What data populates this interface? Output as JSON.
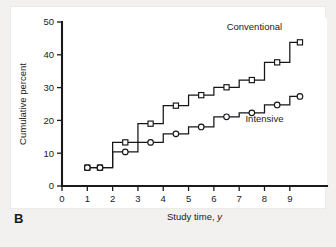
{
  "figure": {
    "panel_label": "B",
    "background_color": "#f2f1ef",
    "plot_background_color": "#ffffff",
    "line_color": "#15161a"
  },
  "chart_data": {
    "type": "line",
    "title": "",
    "subtitle": "",
    "xlabel": "Study time, y",
    "xlabel_parts": {
      "text": "Study time,",
      "italic_unit": "y"
    },
    "ylabel": "Cumulative percent",
    "xlim": [
      0,
      9.6
    ],
    "ylim": [
      0,
      50
    ],
    "xticks": [
      0,
      1,
      2,
      3,
      4,
      5,
      6,
      7,
      8,
      9
    ],
    "xtick_labels": [
      "0",
      "1",
      "2",
      "3",
      "4",
      "5",
      "6",
      "7",
      "8",
      "9"
    ],
    "yticks": [
      0,
      10,
      20,
      30,
      40,
      50
    ],
    "ytick_labels": [
      "0",
      "10",
      "20",
      "30",
      "40",
      "50"
    ],
    "grid": false,
    "legend_position": "inline-annotation",
    "step_type": "post",
    "series": [
      {
        "name": "Conventional",
        "marker": "square",
        "label_x": 7.6,
        "label_y": 47.5,
        "x": [
          1.0,
          1.5,
          2.5,
          3.5,
          4.5,
          5.5,
          6.5,
          7.5,
          8.5,
          9.4
        ],
        "y": [
          5.6,
          5.6,
          13.3,
          19.0,
          24.5,
          27.7,
          30.1,
          32.3,
          37.7,
          43.8
        ],
        "step_x": [
          1.0,
          2.0,
          2.0,
          3.0,
          3.0,
          4.0,
          4.0,
          5.0,
          5.0,
          6.0,
          6.0,
          7.0,
          7.0,
          8.0,
          8.0,
          9.0,
          9.0,
          9.4
        ],
        "step_y": [
          5.6,
          5.6,
          13.3,
          13.3,
          19.0,
          19.0,
          24.5,
          24.5,
          27.7,
          27.7,
          30.1,
          30.1,
          32.3,
          32.3,
          37.7,
          37.7,
          43.8,
          43.8
        ]
      },
      {
        "name": "Intensive",
        "marker": "circle",
        "label_x": 8.0,
        "label_y": 19.5,
        "x": [
          1.0,
          1.5,
          2.5,
          3.5,
          4.5,
          5.5,
          6.5,
          7.5,
          8.5,
          9.4
        ],
        "y": [
          5.6,
          5.6,
          10.4,
          13.3,
          15.9,
          18.0,
          21.1,
          22.3,
          24.7,
          27.3
        ],
        "step_x": [
          1.0,
          2.0,
          2.0,
          3.0,
          3.0,
          4.0,
          4.0,
          5.0,
          5.0,
          6.0,
          6.0,
          7.0,
          7.0,
          8.0,
          8.0,
          9.0,
          9.0,
          9.4
        ],
        "step_y": [
          5.6,
          5.6,
          10.4,
          10.4,
          13.3,
          13.3,
          15.9,
          15.9,
          18.0,
          18.0,
          21.1,
          21.1,
          22.3,
          22.3,
          24.7,
          24.7,
          27.3,
          27.3
        ]
      }
    ],
    "annotations": [
      {
        "text": "Conventional",
        "x": 7.6,
        "y": 47.5
      },
      {
        "text": "Intensive",
        "x": 8.0,
        "y": 19.5
      }
    ]
  }
}
